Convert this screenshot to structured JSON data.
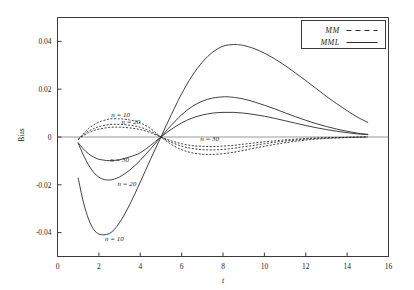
{
  "chart_data": {
    "type": "line",
    "title": "",
    "xlabel": "t",
    "ylabel": "Bias",
    "xlim": [
      0,
      16
    ],
    "ylim": [
      -0.05,
      0.05
    ],
    "xticks": [
      0,
      2,
      4,
      6,
      8,
      10,
      12,
      14,
      16
    ],
    "xticklabels": [
      "0",
      "2",
      "4",
      "6",
      "8",
      "10",
      "12",
      "14",
      "16"
    ],
    "yticks": [
      0.04,
      0.02,
      0,
      -0.02,
      -0.04
    ],
    "yticklabels": [
      "0.04",
      "0.02",
      "0",
      "-0.02",
      "-0.04"
    ],
    "grid": false,
    "zero_reference_line": true,
    "legend": {
      "position": "top-right",
      "entries": [
        {
          "label": "MM",
          "style": "dashed"
        },
        {
          "label": "MML",
          "style": "solid"
        }
      ]
    },
    "annotations": [
      {
        "text": "n = 10",
        "x": 3.05,
        "y": 0.0085
      },
      {
        "text": "n = 20",
        "x": 3.55,
        "y": 0.0055
      },
      {
        "text": "n = 30",
        "x": 7.35,
        "y": -0.0015
      },
      {
        "text": "n = 30",
        "x": 3.0,
        "y": -0.0105
      },
      {
        "text": "n = 20",
        "x": 3.35,
        "y": -0.0205
      },
      {
        "text": "n = 10",
        "x": 2.75,
        "y": -0.0435
      }
    ],
    "series": [
      {
        "name": "MML n = 10",
        "style": "solid",
        "x": [
          1.0,
          1.25,
          1.5,
          1.75,
          2.0,
          2.25,
          2.5,
          2.75,
          3.0,
          3.25,
          3.5,
          3.75,
          4.0,
          4.25,
          4.5,
          4.75,
          5.0,
          5.25,
          5.5,
          5.75,
          6.0,
          6.5,
          7.0,
          7.5,
          8.0,
          8.5,
          8.75,
          9.0,
          9.5,
          10.0,
          10.5,
          11.0,
          11.5,
          12.0,
          12.5,
          13.0,
          13.5,
          14.0,
          14.5,
          15.0
        ],
        "y": [
          -0.0172,
          -0.0272,
          -0.0343,
          -0.0387,
          -0.0406,
          -0.0409,
          -0.0404,
          -0.0387,
          -0.0358,
          -0.0322,
          -0.0281,
          -0.0236,
          -0.0189,
          -0.0141,
          -0.0093,
          -0.0046,
          0.0,
          0.0047,
          0.0093,
          0.0138,
          0.0181,
          0.0255,
          0.0313,
          0.0355,
          0.038,
          0.0387,
          0.0386,
          0.0383,
          0.037,
          0.0351,
          0.0327,
          0.0299,
          0.0268,
          0.0236,
          0.0203,
          0.017,
          0.0139,
          0.011,
          0.0083,
          0.0061
        ]
      },
      {
        "name": "MML n = 20",
        "style": "solid",
        "x": [
          1.0,
          1.25,
          1.5,
          1.75,
          2.0,
          2.25,
          2.5,
          2.75,
          3.0,
          3.25,
          3.5,
          3.75,
          4.0,
          4.25,
          4.5,
          4.75,
          5.0,
          5.25,
          5.5,
          6.0,
          6.5,
          7.0,
          7.5,
          8.0,
          8.25,
          8.5,
          9.0,
          9.5,
          10.0,
          10.5,
          11.0,
          11.5,
          12.0,
          12.5,
          13.0,
          13.5,
          14.0,
          14.5,
          15.0
        ],
        "y": [
          -0.0026,
          -0.0075,
          -0.0117,
          -0.0148,
          -0.0168,
          -0.0178,
          -0.018,
          -0.0176,
          -0.0167,
          -0.0154,
          -0.0138,
          -0.0119,
          -0.0098,
          -0.0074,
          -0.005,
          -0.0025,
          0.0,
          0.0025,
          0.0049,
          0.0093,
          0.0127,
          0.015,
          0.0163,
          0.0168,
          0.0168,
          0.0166,
          0.0159,
          0.0147,
          0.0133,
          0.0118,
          0.0101,
          0.0085,
          0.007,
          0.0056,
          0.0044,
          0.0033,
          0.0024,
          0.0016,
          0.0011
        ]
      },
      {
        "name": "MML n = 30",
        "style": "solid",
        "x": [
          1.0,
          1.25,
          1.5,
          1.75,
          2.0,
          2.5,
          3.0,
          3.5,
          4.0,
          4.5,
          5.0,
          5.5,
          6.0,
          6.5,
          7.0,
          7.5,
          8.0,
          8.5,
          9.0,
          9.5,
          10.0,
          10.5,
          11.0,
          11.5,
          12.0,
          12.5,
          13.0,
          13.5,
          14.0,
          14.5,
          15.0
        ],
        "y": [
          -0.0024,
          -0.005,
          -0.007,
          -0.0084,
          -0.0093,
          -0.0099,
          -0.0095,
          -0.0083,
          -0.0066,
          -0.0035,
          0.0,
          0.0032,
          0.0059,
          0.0079,
          0.0092,
          0.01,
          0.0103,
          0.0103,
          0.01,
          0.0094,
          0.0087,
          0.0078,
          0.0068,
          0.0058,
          0.0048,
          0.0039,
          0.0031,
          0.0024,
          0.0018,
          0.0013,
          0.001
        ]
      },
      {
        "name": "MM n = 10",
        "style": "dashed",
        "x": [
          1.0,
          1.25,
          1.5,
          1.75,
          2.0,
          2.5,
          3.0,
          3.25,
          3.5,
          4.0,
          4.5,
          5.0,
          5.5,
          6.0,
          6.5,
          7.0,
          7.25,
          7.5,
          8.0,
          8.5,
          9.0,
          9.5,
          10.0,
          10.5,
          11.0,
          11.5,
          12.0,
          12.5,
          13.0,
          13.5,
          14.0,
          14.5,
          15.0
        ],
        "y": [
          -0.0012,
          0.0014,
          0.0035,
          0.0051,
          0.0062,
          0.0075,
          0.0076,
          0.0074,
          0.0071,
          0.0059,
          0.0035,
          0.0,
          -0.0031,
          -0.0053,
          -0.0066,
          -0.0072,
          -0.0073,
          -0.0073,
          -0.007,
          -0.0064,
          -0.0056,
          -0.0047,
          -0.0039,
          -0.0031,
          -0.0024,
          -0.0018,
          -0.0013,
          -0.0009,
          -0.0006,
          -0.0004,
          -0.0002,
          -0.0001,
          0.0
        ]
      },
      {
        "name": "MM n = 20",
        "style": "dashed",
        "x": [
          1.0,
          1.25,
          1.5,
          1.75,
          2.0,
          2.5,
          3.0,
          3.5,
          4.0,
          4.5,
          5.0,
          5.5,
          6.0,
          6.5,
          7.0,
          7.5,
          8.0,
          8.5,
          9.0,
          9.5,
          10.0,
          10.5,
          11.0,
          11.5,
          12.0,
          12.5,
          13.0,
          13.5,
          14.0,
          14.5,
          15.0
        ],
        "y": [
          -0.001,
          0.0009,
          0.0024,
          0.0035,
          0.0043,
          0.0052,
          0.0053,
          0.0049,
          0.0041,
          0.0024,
          0.0,
          -0.0022,
          -0.0038,
          -0.0048,
          -0.0053,
          -0.0054,
          -0.0052,
          -0.0047,
          -0.0041,
          -0.0035,
          -0.0028,
          -0.0022,
          -0.0017,
          -0.0013,
          -0.0009,
          -0.0006,
          -0.0004,
          -0.0003,
          -0.0002,
          -0.0001,
          0.0
        ]
      },
      {
        "name": "MM n = 30",
        "style": "dashed",
        "x": [
          1.0,
          1.25,
          1.5,
          1.75,
          2.0,
          2.5,
          3.0,
          3.5,
          4.0,
          4.5,
          5.0,
          5.5,
          6.0,
          6.5,
          7.0,
          7.5,
          8.0,
          8.5,
          9.0,
          9.5,
          10.0,
          10.5,
          11.0,
          11.5,
          12.0,
          12.5,
          13.0,
          13.5,
          14.0,
          14.5,
          15.0
        ],
        "y": [
          -0.0008,
          0.0006,
          0.0018,
          0.0027,
          0.0033,
          0.004,
          0.0041,
          0.0038,
          0.0031,
          0.0018,
          0.0,
          -0.0016,
          -0.0028,
          -0.0036,
          -0.0039,
          -0.004,
          -0.0038,
          -0.0035,
          -0.003,
          -0.0025,
          -0.002,
          -0.0016,
          -0.0012,
          -0.0009,
          -0.0006,
          -0.0004,
          -0.0003,
          -0.0002,
          -0.0001,
          0.0,
          0.0
        ]
      }
    ]
  },
  "colors": {
    "curve": "#2b2b2b",
    "frame": "#3a3a3a",
    "zero_line": "#8d8d8d",
    "background": "#ffffff"
  }
}
